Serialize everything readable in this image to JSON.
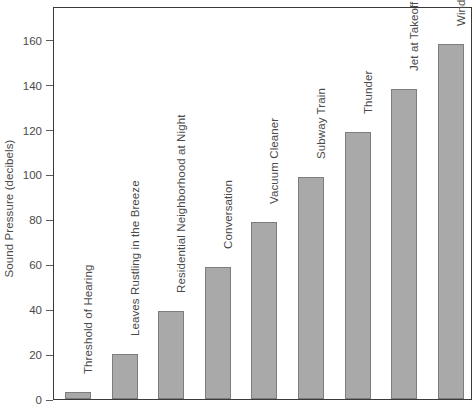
{
  "chart_data": {
    "type": "bar",
    "title": "",
    "xlabel": "",
    "ylabel": "Sound Pressure (decibels)",
    "ylim": [
      0,
      175
    ],
    "yticks": [
      0,
      20,
      40,
      60,
      80,
      100,
      120,
      140,
      160
    ],
    "ytick_labels": [
      "0",
      "20",
      "40",
      "60",
      "80",
      "100",
      "120",
      "140",
      "160"
    ],
    "grid": false,
    "legend": false,
    "orientation": "vertical",
    "bar_color": "#a9a9a9",
    "bar_edge_color": "#7d7d7d",
    "axis_color": "#3a3a3a",
    "text_color": "#4a4a4a",
    "label_rotation": 90,
    "categories": [
      "Threshold of Hearing",
      "Leaves Rustling in the Breeze",
      "Residential Neighborhood at Night",
      "Conversation",
      "Vacuum Cleaner",
      "Subway Train",
      "Thunder",
      "Jet at Takeoff",
      "Wind Tunnnel"
    ],
    "values": [
      3,
      20,
      39,
      59,
      79,
      99,
      119,
      138,
      158
    ]
  }
}
